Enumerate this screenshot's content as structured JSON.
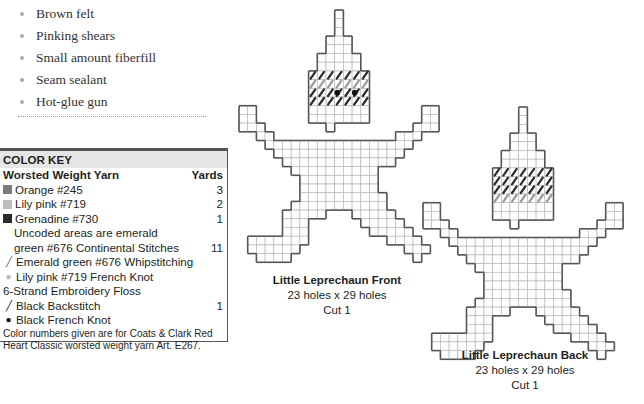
{
  "materials": {
    "items": [
      "Brown felt",
      "Pinking shears",
      "Small amount fiberfill",
      "Seam sealant",
      "Hot-glue gun"
    ]
  },
  "color_key": {
    "title": "COLOR KEY",
    "yarn_header": "Worsted Weight Yarn",
    "yards_header": "Yards",
    "rows": [
      {
        "swatch": "#7a7a7a",
        "label": "Orange #245",
        "yards": "3"
      },
      {
        "swatch": "#bdbdbd",
        "label": "Lily pink #719",
        "yards": "2"
      },
      {
        "swatch": "#2b2b2b",
        "label": "Grenadine #730",
        "yards": "1"
      }
    ],
    "uncoded_line1": "Uncoded areas are emerald",
    "uncoded_line2": "green #676 Continental Stitches",
    "uncoded_yards": "11",
    "whipstitch": "Emerald green #676 Whipstitching",
    "french_knot_pink": "Lily pink #719 French Knot",
    "floss_header": "6-Strand Embroidery Floss",
    "backstitch": "Black Backstitch",
    "backstitch_yards": "1",
    "french_knot_black": "Black French Knot",
    "note": "Color numbers given are for Coats & Clark Red Heart Classic worsted weight yarn Art. E267.",
    "icons": {
      "whipstitch": "╱",
      "french_knot_pink": "●",
      "backstitch": "╱",
      "french_knot_black": "●"
    }
  },
  "pieces": [
    {
      "title": "Little Leprechaun Front",
      "size": "23 holes x 29 holes",
      "cut": "Cut 1"
    },
    {
      "title": "Little Leprechaun Back",
      "size": "23 holes x 29 holes",
      "cut": "Cut 1"
    }
  ],
  "colors": {
    "outline": "#555555",
    "grid": "#b8b8b8",
    "dark_stitch": "#2b2b2b",
    "light_stitch": "#9a9a9a"
  }
}
